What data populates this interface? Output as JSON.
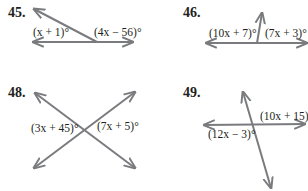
{
  "figures": [
    {
      "number": "45.",
      "labels": [
        "(x + 1)°",
        "(4x − 56)°"
      ]
    },
    {
      "number": "46.",
      "labels": [
        "(10x + 7)°",
        "(7x + 3)°"
      ]
    },
    {
      "number": "48.",
      "labels": [
        "(3x + 45)°",
        "(7x + 5)°"
      ]
    },
    {
      "number": "49.",
      "labels": [
        "(10x + 15)°",
        "(12x − 3)°"
      ]
    }
  ],
  "colors": {
    "line": "#7a7b7e",
    "text": "#231f20"
  }
}
